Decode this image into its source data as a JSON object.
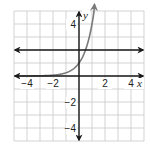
{
  "chart_data": {
    "type": "line",
    "title": "",
    "xlabel": "x",
    "ylabel": "y",
    "xlim": [
      -5,
      5
    ],
    "ylim": [
      -5,
      5
    ],
    "grid": true,
    "grid_step": 1,
    "x_tick_labels": [
      {
        "value": -4,
        "label": "−4"
      },
      {
        "value": -2,
        "label": "−2"
      },
      {
        "value": 2,
        "label": "2"
      },
      {
        "value": 4,
        "label": "4"
      }
    ],
    "y_tick_labels": [
      {
        "value": 4,
        "label": "4"
      },
      {
        "value": -2,
        "label": "−2"
      },
      {
        "value": -4,
        "label": "−4"
      }
    ],
    "series": [
      {
        "name": "exponential curve",
        "function": "y = 4^x",
        "color": "#7a7a7a",
        "x": [
          -5,
          -4,
          -3,
          -2,
          -1.5,
          -1,
          -0.5,
          0,
          0.25,
          0.5,
          0.75,
          1,
          1.16
        ],
        "y": [
          0.001,
          0.004,
          0.016,
          0.06,
          0.13,
          0.25,
          0.5,
          1,
          1.41,
          2,
          2.83,
          4,
          5
        ]
      },
      {
        "name": "horizontal line",
        "function": "y = 2",
        "color": "#1a1a1a",
        "x": [
          -5,
          5
        ],
        "y": [
          2,
          2
        ]
      }
    ],
    "axis_color": "#1a1a1a",
    "grid_color": "#c8c8c8"
  }
}
